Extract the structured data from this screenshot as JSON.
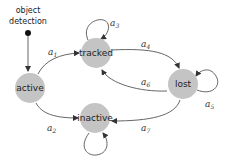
{
  "diagram": {
    "type": "state-machine",
    "start_label_line1": "object",
    "start_label_line2": "detection",
    "states": [
      {
        "id": "active",
        "label": "active"
      },
      {
        "id": "tracked",
        "label": "tracked"
      },
      {
        "id": "lost",
        "label": "lost"
      },
      {
        "id": "inactive",
        "label": "inactive"
      }
    ],
    "transitions": [
      {
        "id": "a1",
        "from": "active",
        "to": "tracked",
        "label": "a",
        "sub": "1"
      },
      {
        "id": "a2",
        "from": "active",
        "to": "inactive",
        "label": "a",
        "sub": "2"
      },
      {
        "id": "a3",
        "from": "tracked",
        "to": "tracked",
        "label": "a",
        "sub": "3"
      },
      {
        "id": "a4",
        "from": "tracked",
        "to": "lost",
        "label": "a",
        "sub": "4"
      },
      {
        "id": "a5",
        "from": "lost",
        "to": "lost",
        "label": "a",
        "sub": "5"
      },
      {
        "id": "a6",
        "from": "lost",
        "to": "tracked",
        "label": "a",
        "sub": "6"
      },
      {
        "id": "a7",
        "from": "lost",
        "to": "inactive",
        "label": "a",
        "sub": "7"
      },
      {
        "id": "a8",
        "from": "inactive",
        "to": "inactive",
        "label": "",
        "sub": ""
      }
    ],
    "colors": {
      "node_fill": "#c4c4c4",
      "edge": "#555555",
      "start_dot": "#111111"
    }
  }
}
